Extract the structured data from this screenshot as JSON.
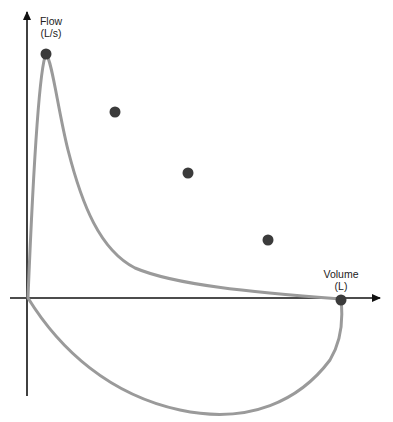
{
  "diagram": {
    "type": "flow-volume loop",
    "y_axis": {
      "label": "Flow",
      "unit": "(L/s)"
    },
    "x_axis": {
      "label": "Volume",
      "unit": "(L)"
    },
    "colors": {
      "axis": "#111111",
      "curve": "#9a9a9a",
      "dot": "#3b3b3b",
      "background": "#ffffff"
    },
    "markers": [
      {
        "name": "peak-flow-point",
        "x": 46,
        "y": 54
      },
      {
        "name": "point-1",
        "x": 115,
        "y": 112
      },
      {
        "name": "point-2",
        "x": 188,
        "y": 173
      },
      {
        "name": "point-3",
        "x": 268,
        "y": 240
      },
      {
        "name": "end-volume-point",
        "x": 341,
        "y": 300
      }
    ]
  }
}
